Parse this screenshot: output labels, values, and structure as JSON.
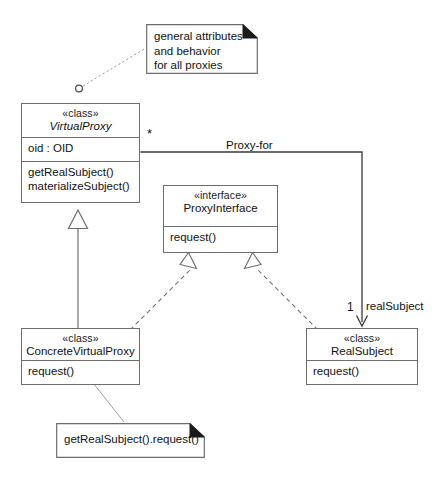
{
  "diagram": {
    "kind": "uml-class-diagram",
    "stroke_color": "#6d6d6d",
    "text_color": "#111111",
    "background": "#ffffff"
  },
  "classes": [
    {
      "id": "virtual-proxy",
      "stereotype": "«class»",
      "name": "VirtualProxy",
      "abstract": true,
      "attributes": [
        "oid : OID"
      ],
      "operations": [
        "getRealSubject()",
        "materializeSubject()"
      ]
    },
    {
      "id": "proxy-interface",
      "stereotype": "«interface»",
      "name": "ProxyInterface",
      "abstract": false,
      "attributes": [],
      "operations": [
        "request()"
      ]
    },
    {
      "id": "concrete-virtual-proxy",
      "stereotype": "«class»",
      "name": "ConcreteVirtualProxy",
      "abstract": false,
      "attributes": [],
      "operations": [
        "request()"
      ]
    },
    {
      "id": "real-subject",
      "stereotype": "«class»",
      "name": "RealSubject",
      "abstract": false,
      "attributes": [],
      "operations": [
        "request()"
      ]
    }
  ],
  "notes": [
    {
      "id": "note-general",
      "lines": [
        "general attributes",
        "and behavior",
        "for all proxies"
      ],
      "anchored_to": "virtual-proxy"
    },
    {
      "id": "note-body",
      "lines": [
        "getRealSubject().request()"
      ],
      "anchored_to": "concrete-virtual-proxy"
    }
  ],
  "associations": [
    {
      "id": "proxy-for",
      "label": "Proxy-for",
      "source": "virtual-proxy",
      "target": "real-subject",
      "source_multiplicity": "*",
      "target_multiplicity": "1",
      "target_role": "realSubject",
      "navigable": true
    }
  ],
  "generalizations": [
    {
      "id": "gen-cvp-vp",
      "source": "concrete-virtual-proxy",
      "target": "virtual-proxy"
    }
  ],
  "realizations": [
    {
      "id": "real-vp-pi",
      "source": "virtual-proxy",
      "target": "proxy-interface"
    },
    {
      "id": "real-rs-pi",
      "source": "real-subject",
      "target": "proxy-interface"
    }
  ],
  "caption": {
    "text": ""
  }
}
